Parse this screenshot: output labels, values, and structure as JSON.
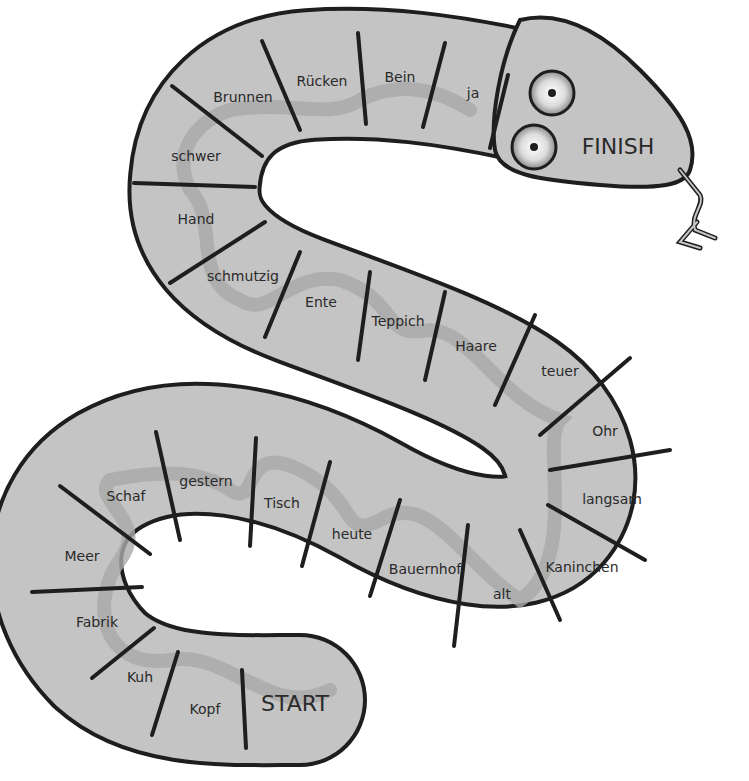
{
  "board": {
    "colors": {
      "body": "#c4c4c4",
      "outline": "#1e1e1e",
      "ribbon": "#a9a9a9",
      "text": "#2a2a2a",
      "background": "#ffffff"
    },
    "start_label": "START",
    "finish_label": "FINISH",
    "cells": [
      {
        "label": "Kopf"
      },
      {
        "label": "Kuh"
      },
      {
        "label": "Fabrik"
      },
      {
        "label": "Meer"
      },
      {
        "label": "Schaf"
      },
      {
        "label": "gestern"
      },
      {
        "label": "Tisch"
      },
      {
        "label": "heute"
      },
      {
        "label": "Bauernhof"
      },
      {
        "label": "alt"
      },
      {
        "label": "Kaninchen"
      },
      {
        "label": "langsam"
      },
      {
        "label": "Ohr"
      },
      {
        "label": "teuer"
      },
      {
        "label": "Haare"
      },
      {
        "label": "Teppich"
      },
      {
        "label": "Ente"
      },
      {
        "label": "schmutzig"
      },
      {
        "label": "Hand"
      },
      {
        "label": "schwer"
      },
      {
        "label": "Brunnen"
      },
      {
        "label": "Rücken"
      },
      {
        "label": "Bein"
      },
      {
        "label": "ja"
      }
    ]
  }
}
